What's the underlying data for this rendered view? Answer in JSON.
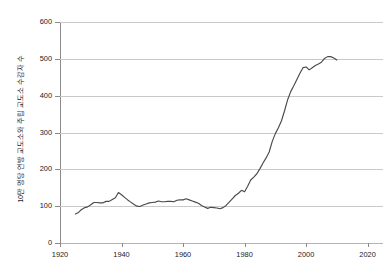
{
  "chart_data": {
    "type": "line",
    "title": "",
    "subtitle": "",
    "xlabel": "",
    "ylabel": "10만 명당 연방 교도소와 주립 교도소 수감자 수",
    "xlim": [
      1920,
      2025
    ],
    "ylim": [
      0,
      600
    ],
    "xticks": [
      1920,
      1940,
      1960,
      1980,
      2000,
      2020
    ],
    "yticks": [
      0,
      100,
      200,
      300,
      400,
      500,
      600
    ],
    "xtick_labels": [
      "1920",
      "1940",
      "1960",
      "1980",
      "2000",
      "2020"
    ],
    "ytick_labels": [
      "0",
      "100",
      "200",
      "300",
      "400",
      "500",
      "600"
    ],
    "grid": "horizontal",
    "legend": "none",
    "line_color": "#4a4a4a",
    "grid_color": "#c9c9c9",
    "axis_color": "#8a8a8a",
    "background": "#ffffff",
    "series": [
      {
        "name": "미국 수감률",
        "x": [
          1925,
          1926,
          1927,
          1928,
          1929,
          1930,
          1931,
          1932,
          1933,
          1934,
          1935,
          1936,
          1937,
          1938,
          1939,
          1940,
          1941,
          1942,
          1943,
          1944,
          1945,
          1946,
          1947,
          1948,
          1949,
          1950,
          1951,
          1952,
          1953,
          1954,
          1955,
          1956,
          1957,
          1958,
          1959,
          1960,
          1961,
          1962,
          1963,
          1964,
          1965,
          1966,
          1967,
          1968,
          1969,
          1970,
          1971,
          1972,
          1973,
          1974,
          1975,
          1976,
          1977,
          1978,
          1979,
          1980,
          1981,
          1982,
          1983,
          1984,
          1985,
          1986,
          1987,
          1988,
          1989,
          1990,
          1991,
          1992,
          1993,
          1994,
          1995,
          1996,
          1997,
          1998,
          1999,
          2000,
          2001,
          2002,
          2003,
          2004,
          2005,
          2006,
          2007,
          2008,
          2009,
          2010
        ],
        "values": [
          79,
          83,
          91,
          96,
          98,
          104,
          110,
          110,
          109,
          109,
          113,
          113,
          118,
          123,
          137,
          131,
          124,
          117,
          111,
          105,
          100,
          99,
          103,
          106,
          109,
          110,
          111,
          114,
          112,
          112,
          113,
          113,
          112,
          116,
          117,
          117,
          120,
          117,
          114,
          111,
          108,
          102,
          98,
          94,
          97,
          96,
          95,
          93,
          96,
          102,
          111,
          120,
          129,
          135,
          143,
          139,
          154,
          171,
          179,
          188,
          202,
          217,
          231,
          247,
          276,
          297,
          313,
          332,
          359,
          389,
          411,
          427,
          444,
          461,
          476,
          478,
          470,
          476,
          482,
          486,
          491,
          501,
          506,
          506,
          502,
          497
        ]
      }
    ],
    "annotations": []
  }
}
